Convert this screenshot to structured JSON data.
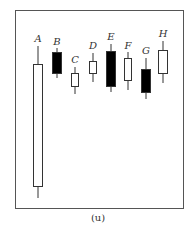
{
  "figure": {
    "caption": "(u)",
    "frame_color": "#555555",
    "bullish_fill": "#ffffff",
    "bearish_fill": "#000000",
    "stroke": "#333333"
  },
  "chart_data": {
    "type": "candlestick",
    "title": "",
    "caption": "(u)",
    "xlabel": "",
    "ylabel": "",
    "grid": false,
    "legend": "none",
    "categories": [
      "A",
      "B",
      "C",
      "D",
      "E",
      "F",
      "G",
      "H"
    ],
    "candles": [
      {
        "label": "A",
        "color": "white",
        "x": 38,
        "half_width": 5,
        "label_y": 42,
        "wick_top": 46,
        "body_top": 64,
        "body_bottom": 186,
        "wick_bottom": 198
      },
      {
        "label": "B",
        "color": "black",
        "x": 57,
        "half_width": 5,
        "label_y": 45,
        "wick_top": 48,
        "body_top": 52,
        "body_bottom": 73,
        "wick_bottom": 78
      },
      {
        "label": "C",
        "color": "white",
        "x": 75,
        "half_width": 4,
        "label_y": 63,
        "wick_top": 67,
        "body_top": 73,
        "body_bottom": 86,
        "wick_bottom": 94
      },
      {
        "label": "D",
        "color": "white",
        "x": 93,
        "half_width": 4,
        "label_y": 49,
        "wick_top": 53,
        "body_top": 61,
        "body_bottom": 73,
        "wick_bottom": 82
      },
      {
        "label": "E",
        "color": "black",
        "x": 111,
        "half_width": 5,
        "label_y": 40,
        "wick_top": 44,
        "body_top": 51,
        "body_bottom": 86,
        "wick_bottom": 92
      },
      {
        "label": "F",
        "color": "white",
        "x": 128,
        "half_width": 4,
        "label_y": 49,
        "wick_top": 52,
        "body_top": 58,
        "body_bottom": 80,
        "wick_bottom": 90
      },
      {
        "label": "G",
        "color": "black",
        "x": 146,
        "half_width": 5,
        "label_y": 54,
        "wick_top": 58,
        "body_top": 69,
        "body_bottom": 92,
        "wick_bottom": 99
      },
      {
        "label": "H",
        "color": "white",
        "x": 163,
        "half_width": 5,
        "label_y": 37,
        "wick_top": 41,
        "body_top": 50,
        "body_bottom": 73,
        "wick_bottom": 83
      }
    ],
    "note": "Values are pixel y-positions (smaller = higher price); no axis scale is shown."
  }
}
